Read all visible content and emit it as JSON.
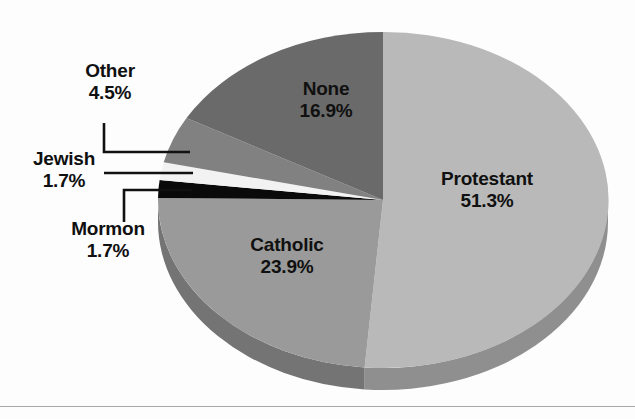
{
  "chart_data": {
    "type": "pie",
    "title": "",
    "subtitle": "",
    "xlabel": "",
    "ylabel": "",
    "legend_position": "none",
    "grid": false,
    "units": "percent",
    "label_format": "name + percent",
    "start_angle_deg": 0,
    "direction": "clockwise",
    "style": "3d-pie",
    "categories": [
      "Protestant",
      "Catholic",
      "Mormon",
      "Jewish",
      "Other",
      "None"
    ],
    "values": [
      51.3,
      23.9,
      1.7,
      1.7,
      4.5,
      16.9
    ],
    "slices": [
      {
        "name": "Protestant",
        "value": 51.3,
        "value_text": "51.3%",
        "color": "#b9b9b9",
        "side_color": "#8f8f8f",
        "label_placement": "inside"
      },
      {
        "name": "Catholic",
        "value": 23.9,
        "value_text": "23.9%",
        "color": "#9a9a9a",
        "side_color": "#747474",
        "label_placement": "inside"
      },
      {
        "name": "Mormon",
        "value": 1.7,
        "value_text": "1.7%",
        "color": "#0a0a0a",
        "side_color": "#000000",
        "label_placement": "outside-leader"
      },
      {
        "name": "Jewish",
        "value": 1.7,
        "value_text": "1.7%",
        "color": "#f2f2f2",
        "side_color": "#d2d2d2",
        "label_placement": "outside-leader"
      },
      {
        "name": "Other",
        "value": 4.5,
        "value_text": "4.5%",
        "color": "#818181",
        "side_color": "#636363",
        "label_placement": "outside-leader"
      },
      {
        "name": "None",
        "value": 16.9,
        "value_text": "16.9%",
        "color": "#6a6a6a",
        "side_color": "#4e4e4e",
        "label_placement": "inside"
      }
    ]
  },
  "labels": {
    "none": {
      "name": "None",
      "value": "16.9%"
    },
    "protestant": {
      "name": "Protestant",
      "value": "51.3%"
    },
    "catholic": {
      "name": "Catholic",
      "value": "23.9%"
    },
    "other": {
      "name": "Other",
      "value": "4.5%"
    },
    "jewish": {
      "name": "Jewish",
      "value": "1.7%"
    },
    "mormon": {
      "name": "Mormon",
      "value": "1.7%"
    }
  },
  "colors": {
    "background": "#fdfdfd",
    "text": "#101010",
    "leader_line": "#111111",
    "baseline_rule": "#a9a9a9"
  }
}
